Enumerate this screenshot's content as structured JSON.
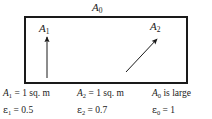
{
  "figure": {
    "type": "radiation-enclosure-diagram",
    "enclosure_label": "A",
    "enclosure_label_sub": "0",
    "surfaces": [
      {
        "name": "surface-a1",
        "label": "A",
        "label_sub": "1",
        "arrow": "vertical-up",
        "arrow_name": "arrow-a1"
      },
      {
        "name": "surface-a2",
        "label": "A",
        "label_sub": "2",
        "arrow": "diagonal-up-right",
        "arrow_name": "arrow-a2"
      }
    ]
  },
  "captions": [
    {
      "area_symbol": "A",
      "area_sub": "1",
      "area_text": " = 1 sq. m",
      "eps_symbol": "ε",
      "eps_sub": "1",
      "eps_text": " = 0.5"
    },
    {
      "area_symbol": "A",
      "area_sub": "2",
      "area_text": " = 1 sq. m",
      "eps_symbol": "ε",
      "eps_sub": "2",
      "eps_text": " = 0.7"
    },
    {
      "area_symbol": "A",
      "area_sub": "0",
      "area_text": " is large",
      "eps_symbol": "ε",
      "eps_sub": "0",
      "eps_text": " = 1"
    }
  ],
  "colors": {
    "line": "#1a1a1a",
    "background": "#ffffff"
  }
}
